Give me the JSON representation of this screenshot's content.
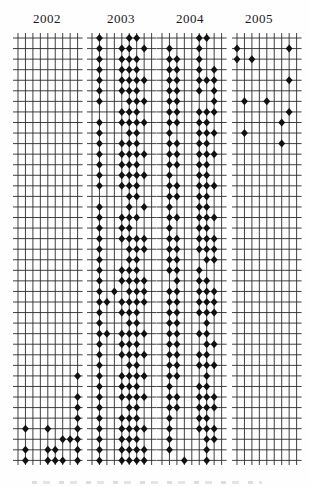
{
  "chart_data": {
    "type": "scatter",
    "title": "",
    "grid": {
      "rows": 41,
      "cols": 9
    },
    "colors": {
      "marker": "#111111",
      "line": "#2b2b2b",
      "background": "#fefefe"
    },
    "panels": [
      {
        "year": "2002",
        "rows": [
          "000000000",
          "000000000",
          "000000000",
          "000000000",
          "000000000",
          "000000000",
          "000000000",
          "000000000",
          "000000000",
          "000000000",
          "000000000",
          "000000000",
          "000000000",
          "000000000",
          "000000000",
          "000000000",
          "000000000",
          "000000000",
          "000000000",
          "000000000",
          "000000000",
          "000000000",
          "000000000",
          "000000000",
          "000000000",
          "000000000",
          "000000000",
          "000000000",
          "000000000",
          "000000000",
          "000000000",
          "000000000",
          "000000001",
          "000000000",
          "000000001",
          "000000001",
          "000000001",
          "010010001",
          "000000111",
          "010011001",
          "010011101"
        ]
      },
      {
        "year": "2003",
        "rows": [
          "010001100",
          "010011010",
          "010011100",
          "010011100",
          "010011110",
          "010011100",
          "010001110",
          "000011100",
          "010011110",
          "010001100",
          "010011100",
          "010011110",
          "010011100",
          "010011110",
          "010011100",
          "000001100",
          "010001010",
          "010011100",
          "010011000",
          "010011110",
          "010001110",
          "010001100",
          "010011100",
          "010011110",
          "010101110",
          "011011110",
          "010011100",
          "010001100",
          "011011110",
          "010011100",
          "010011110",
          "010001100",
          "010011110",
          "010011100",
          "010011110",
          "010001100",
          "010011100",
          "010011110",
          "010011100",
          "010011110",
          "010011110"
        ]
      },
      {
        "year": "2004",
        "rows": [
          "000001100",
          "010001000",
          "011001000",
          "011001010",
          "011001110",
          "011001010",
          "011000010",
          "011001110",
          "011001100",
          "010001110",
          "011001100",
          "011001110",
          "011001100",
          "010001100",
          "011001110",
          "011001100",
          "010001100",
          "011001110",
          "010001100",
          "011001110",
          "011001110",
          "011000110",
          "011001000",
          "001001100",
          "011001110",
          "011001110",
          "011001110",
          "011000100",
          "011001100",
          "011000110",
          "011001100",
          "011001110",
          "011000100",
          "010001100",
          "011001110",
          "011001110",
          "010001100",
          "010001110",
          "010000110",
          "010000100",
          "000100100"
        ]
      },
      {
        "year": "2005",
        "rows": [
          "000000000",
          "100000010",
          "101000000",
          "000000000",
          "000000010",
          "000000000",
          "010010000",
          "000000010",
          "000000100",
          "010000000",
          "000000100",
          "000000000",
          "000000000",
          "000000000",
          "000000000",
          "000000000",
          "000000000",
          "000000000",
          "000000000",
          "000000000",
          "000000000",
          "000000000",
          "000000000",
          "000000000",
          "000000000",
          "000000000",
          "000000000",
          "000000000",
          "000000000",
          "000000000",
          "000000000",
          "000000000",
          "000000000",
          "000000000",
          "000000000",
          "000000000",
          "000000000",
          "000000000",
          "000000000",
          "000000000",
          "000000000"
        ]
      }
    ]
  }
}
